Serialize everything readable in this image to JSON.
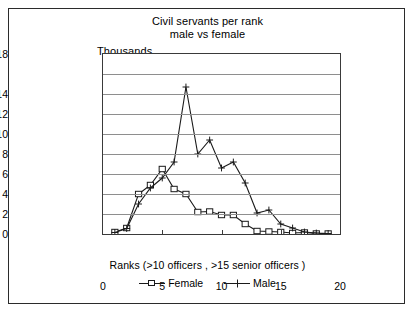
{
  "chart_data": {
    "type": "line",
    "title": "Civil servants per rank\nmale vs female",
    "title_line1": "Civil servants per rank",
    "title_line2": "male vs female",
    "ylabel": "Thousands",
    "xlabel": "Ranks (>10 officers ,  >15 senior officers )",
    "x": [
      1,
      2,
      3,
      4,
      5,
      6,
      7,
      8,
      9,
      10,
      11,
      12,
      13,
      14,
      15,
      16,
      17,
      18,
      19
    ],
    "xlim": [
      0,
      20
    ],
    "ylim": [
      0,
      18
    ],
    "xticks": [
      0,
      5,
      10,
      15,
      20
    ],
    "yticks": [
      0,
      2,
      4,
      6,
      8,
      10,
      12,
      14,
      18
    ],
    "ytick_labels": [
      "0",
      "2",
      "4",
      "6",
      "8",
      "10",
      "12",
      "14",
      "18"
    ],
    "gridlines": [
      0,
      2,
      4,
      6,
      8,
      10,
      12,
      14,
      16,
      18
    ],
    "grid": true,
    "legend_position": "bottom",
    "series": [
      {
        "name": "Female",
        "marker": "open-square",
        "color": "#1a1a1a",
        "values": [
          0.2,
          0.6,
          4.0,
          4.9,
          6.5,
          4.5,
          4.0,
          2.2,
          2.25,
          1.9,
          1.9,
          1.0,
          0.3,
          0.25,
          0.2,
          0.1,
          0.15,
          0.05,
          0.05
        ]
      },
      {
        "name": "Male",
        "marker": "plus",
        "color": "#1a1a1a",
        "values": [
          0.15,
          0.55,
          3.0,
          4.6,
          5.6,
          7.2,
          14.7,
          8.0,
          9.4,
          6.6,
          7.2,
          5.1,
          2.1,
          2.4,
          1.0,
          0.6,
          0.2,
          0.1,
          0.05
        ]
      }
    ]
  },
  "legend": {
    "items": [
      {
        "label": "Female"
      },
      {
        "label": "Male"
      }
    ]
  },
  "colors": {
    "ink": "#1a1a1a",
    "grid": "#8e8e8e",
    "frame": "#3a3a3a",
    "border": "#2b2b2b",
    "background": "#ffffff"
  }
}
